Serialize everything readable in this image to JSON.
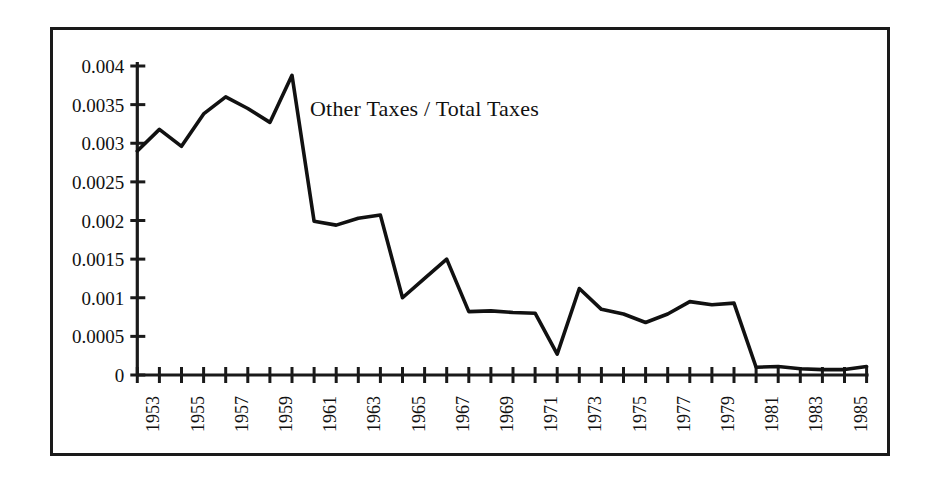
{
  "chart_data": {
    "type": "line",
    "title": "Other Taxes / Total Taxes",
    "xlabel": "",
    "ylabel": "",
    "grid": false,
    "legend": "none",
    "line_color": "#111111",
    "background_color": "#ffffff",
    "frame_color": "#1a1a1a",
    "xlim": [
      1953,
      1986
    ],
    "ylim": [
      0,
      0.004
    ],
    "x": [
      1953,
      1954,
      1955,
      1956,
      1957,
      1958,
      1959,
      1960,
      1961,
      1962,
      1963,
      1964,
      1965,
      1966,
      1967,
      1968,
      1969,
      1970,
      1971,
      1972,
      1973,
      1974,
      1975,
      1976,
      1977,
      1978,
      1979,
      1980,
      1981,
      1982,
      1983,
      1984,
      1985,
      1986
    ],
    "values": [
      0.0029,
      0.00318,
      0.00296,
      0.00338,
      0.0036,
      0.00345,
      0.00327,
      0.00388,
      0.00199,
      0.00194,
      0.00203,
      0.00207,
      0.001,
      0.00125,
      0.0015,
      0.00082,
      0.00083,
      0.00081,
      0.0008,
      0.00027,
      0.00112,
      0.00085,
      0.00079,
      0.00068,
      0.00079,
      0.00095,
      0.00091,
      0.00093,
      0.0001,
      0.00011,
      8e-05,
      7e-05,
      7e-05,
      0.00011
    ],
    "y_ticks": [
      0,
      0.0005,
      0.001,
      0.0015,
      0.002,
      0.0025,
      0.003,
      0.0035,
      0.004
    ],
    "y_tick_labels": [
      "0",
      "0.0005",
      "0.001",
      "0.0015",
      "0.002",
      "0.0025",
      "0.003",
      "0.0035",
      "0.004"
    ],
    "x_ticks": [
      1953,
      1954,
      1955,
      1956,
      1957,
      1958,
      1959,
      1960,
      1961,
      1962,
      1963,
      1964,
      1965,
      1966,
      1967,
      1968,
      1969,
      1970,
      1971,
      1972,
      1973,
      1974,
      1975,
      1976,
      1977,
      1978,
      1979,
      1980,
      1981,
      1982,
      1983,
      1984,
      1985,
      1986
    ],
    "x_tick_labels": [
      "1953",
      "",
      "1955",
      "",
      "1957",
      "",
      "1959",
      "",
      "1961",
      "",
      "1963",
      "",
      "1965",
      "",
      "1967",
      "",
      "1969",
      "",
      "1971",
      "",
      "1973",
      "",
      "1975",
      "",
      "1977",
      "",
      "1979",
      "",
      "1981",
      "",
      "1983",
      "",
      "1985",
      ""
    ]
  }
}
